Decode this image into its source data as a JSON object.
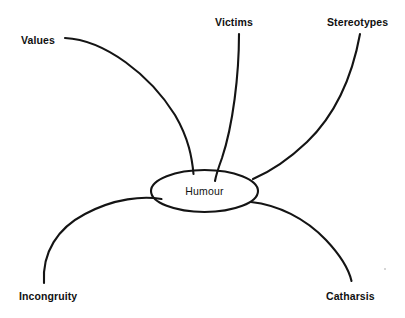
{
  "diagram": {
    "type": "concept-map",
    "title_visible": false,
    "center": {
      "label": "Humour",
      "shape": "ellipse",
      "cx": 204.5,
      "cy": 191,
      "rx": 53.5,
      "ry": 21
    },
    "stroke_color": "#141414",
    "background_color": "#ffffff",
    "text_color": "#111111",
    "branches": [
      {
        "id": "values",
        "label": "Values",
        "label_x": 21,
        "label_y": 35,
        "path": "M65,38 C105,40 150,75 175,115 C189,139 192,158 193.5,174",
        "position": "top-left"
      },
      {
        "id": "victims",
        "label": "Victims",
        "label_x": 215,
        "label_y": 17,
        "path": "M239,34 C239,75 233,125 222,158 C218,169 216,175 215,181",
        "position": "top-center"
      },
      {
        "id": "stereotypes",
        "label": "Stereotypes",
        "label_x": 327,
        "label_y": 17,
        "path": "M360,34 C352,78 335,115 307,142 C286,162 267,173 253,179",
        "position": "top-right"
      },
      {
        "id": "incongruity",
        "label": "Incongruity",
        "label_x": 19,
        "label_y": 291,
        "path": "M44,283 C42,252 58,228 85,214 C115,198 143,196 161.5,199",
        "position": "bottom-left"
      },
      {
        "id": "catharsis",
        "label": "Catharsis",
        "label_x": 326,
        "label_y": 291,
        "path": "M251,202 C278,205 305,218 326,240 C342,257 349,270 351.5,281",
        "position": "bottom-right"
      }
    ]
  }
}
